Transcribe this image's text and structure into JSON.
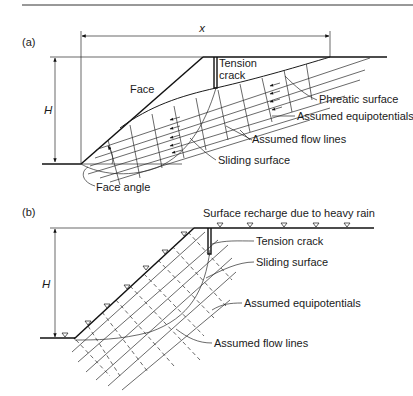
{
  "figure": {
    "panels": [
      {
        "id": "a",
        "label": "(a)",
        "dimension_x": "x",
        "dimension_h": "H",
        "annotations": {
          "tension_crack_line1": "Tension",
          "tension_crack_line2": "crack",
          "face": "Face",
          "phreatic_surface": "Phreatic surface",
          "assumed_equipotentials": "Assumed equipotentials",
          "assumed_flow_lines": "Assumed flow lines",
          "sliding_surface": "Sliding surface",
          "face_angle": "Face angle"
        }
      },
      {
        "id": "b",
        "label": "(b)",
        "dimension_h": "H",
        "annotations": {
          "surface_recharge": "Surface recharge due to heavy rain",
          "tension_crack": "Tension crack",
          "sliding_surface": "Sliding surface",
          "assumed_equipotentials": "Assumed equipotentials",
          "assumed_flow_lines": "Assumed flow lines"
        }
      }
    ]
  }
}
